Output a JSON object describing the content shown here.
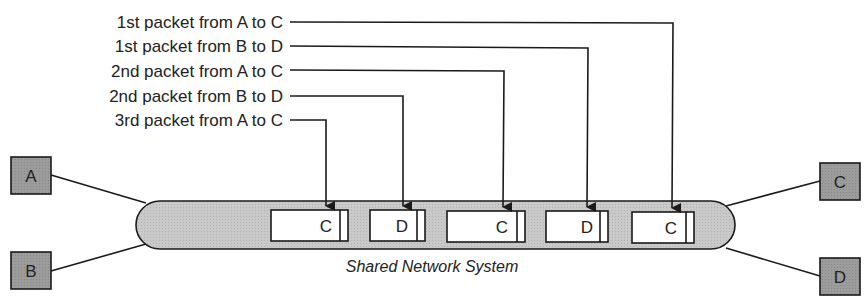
{
  "diagram": {
    "title_caption": "Shared Network System",
    "colors": {
      "line": "#1a1a1a",
      "host_fill": "#9a9a9a",
      "tube_fill": "#c8c8c8",
      "packet_fill": "#ffffff"
    },
    "hosts": [
      {
        "id": "A",
        "label": "A",
        "side": "left"
      },
      {
        "id": "B",
        "label": "B",
        "side": "left"
      },
      {
        "id": "C",
        "label": "C",
        "side": "right"
      },
      {
        "id": "D",
        "label": "D",
        "side": "right"
      }
    ],
    "packet_labels": [
      {
        "text": "1st packet from A to C",
        "target_packet": 4
      },
      {
        "text": "1st packet from B to D",
        "target_packet": 3
      },
      {
        "text": "2nd packet from A to C",
        "target_packet": 2
      },
      {
        "text": "2nd packet from B to D",
        "target_packet": 1
      },
      {
        "text": "3rd packet from A to C",
        "target_packet": 0
      }
    ],
    "packets": [
      {
        "dest": "C"
      },
      {
        "dest": "D"
      },
      {
        "dest": "C"
      },
      {
        "dest": "D"
      },
      {
        "dest": "C"
      }
    ]
  }
}
